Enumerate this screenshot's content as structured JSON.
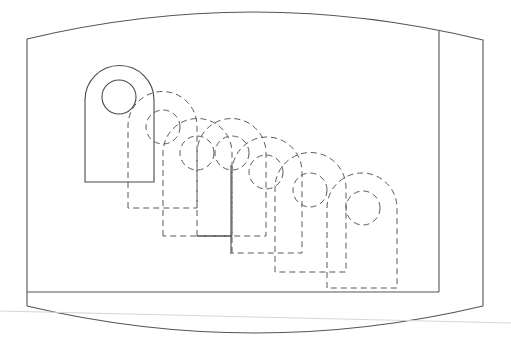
{
  "diagram": {
    "type": "technical-drawing",
    "colors": {
      "stroke": "#4a4a4a",
      "dashed_stroke": "#5a5a5a",
      "faint_line": "#d6d6d6",
      "background": "#ffffff"
    },
    "frame": {
      "outer_left_x": 27,
      "outer_right_x": 483,
      "top_left": [
        27,
        39
      ],
      "top_right": [
        483,
        40
      ],
      "top_peak_y": 12,
      "bottom_left": [
        27,
        306
      ],
      "bottom_right": [
        483,
        306
      ],
      "bottom_low_y": 333,
      "inner_divider_x": 439,
      "inner_divider_top_y": 31,
      "inner_bottom_y": 292
    },
    "faint_line": {
      "from": [
        0,
        311
      ],
      "to": [
        511,
        323
      ]
    },
    "lugs": [
      {
        "id": "S0",
        "style": "solid",
        "left": 85,
        "right": 154,
        "arc_cy": 100,
        "bottom": 182,
        "hole": {
          "cx": 119,
          "cy": 97,
          "r": 17
        }
      },
      {
        "id": "S1",
        "style": "dashed",
        "left": 128,
        "right": 197,
        "arc_cy": 126,
        "bottom": 208,
        "hole": {
          "cx": 163,
          "cy": 127,
          "r": 17
        }
      },
      {
        "id": "S2",
        "style": "dashed",
        "left": 163,
        "right": 232,
        "arc_cy": 153,
        "bottom": 236,
        "hole": {
          "cx": 197,
          "cy": 153,
          "r": 17
        }
      },
      {
        "id": "S3",
        "style": "dashed",
        "left": 197,
        "right": 266,
        "arc_cy": 153,
        "bottom": 236,
        "hole": {
          "cx": 232,
          "cy": 153,
          "r": 17
        }
      },
      {
        "id": "S4",
        "style": "dashed",
        "left": 232,
        "right": 302,
        "arc_cy": 172,
        "bottom": 253,
        "hole": {
          "cx": 266,
          "cy": 172,
          "r": 17
        }
      },
      {
        "id": "S5",
        "style": "dashed",
        "left": 275,
        "right": 346,
        "arc_cy": 188,
        "bottom": 272,
        "hole": {
          "cx": 310,
          "cy": 190,
          "r": 17
        }
      },
      {
        "id": "S6",
        "style": "dashed",
        "left": 327,
        "right": 397,
        "arc_cy": 208,
        "bottom": 288,
        "hole": {
          "cx": 363,
          "cy": 208,
          "r": 17
        }
      }
    ],
    "solid_segments": [
      {
        "from": [
          231,
          165
        ],
        "to": [
          231,
          254
        ]
      },
      {
        "from": [
          197,
          236
        ],
        "to": [
          232,
          236
        ]
      }
    ]
  }
}
